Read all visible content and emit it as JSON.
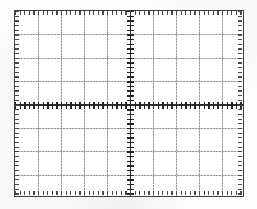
{
  "document": {
    "kind": "oscilloscope-graticule",
    "title": "Oscilloscope Graticule",
    "description": "Blank CRT oscilloscope screen graticule with 10 horizontal by 8 vertical divisions"
  },
  "canvas": {
    "width": 257,
    "height": 209,
    "background_color": "#fefefe"
  },
  "graticule": {
    "left": 14,
    "top": 10,
    "width": 230,
    "height": 187,
    "border_color": "#3d3d3d",
    "border_width": 1.5,
    "screen_color": "#ffffff",
    "divisions_x": 10,
    "divisions_y": 8,
    "division_width": 23.0,
    "division_height": 23.375,
    "grid_color": "#8f8f8f",
    "grid_style": "dotted"
  },
  "axes": {
    "color": "#2e2e2e",
    "vertical": {
      "label": "center-vertical-axis",
      "division_index": 5,
      "x": 115.0
    },
    "horizontal": {
      "label": "center-horizontal-axis",
      "division_index": 4,
      "y": 93.5
    }
  },
  "ticks": {
    "color": "#242424",
    "subdivisions_per_division": 5,
    "spacing_x": 4.6,
    "spacing_y": 4.675,
    "length": 7,
    "vertical_axis_tick_count": 41,
    "horizontal_axis_tick_count": 51
  },
  "edge_ticks": {
    "color": "#4a4a4a",
    "length": 4,
    "subdivisions_per_division": 5
  },
  "chart_data": {
    "type": "line",
    "subtitle": "",
    "xlabel": "",
    "ylabel": "",
    "xlim": [
      -5,
      5
    ],
    "ylim": [
      -4,
      4
    ],
    "xticks": [
      -5,
      -4,
      -3,
      -2,
      -1,
      0,
      1,
      2,
      3,
      4,
      5
    ],
    "yticks": [
      -4,
      -3,
      -2,
      -1,
      0,
      1,
      2,
      3,
      4
    ],
    "xtick_labels": [
      "",
      "",
      "",
      "",
      "",
      "",
      "",
      "",
      "",
      "",
      ""
    ],
    "ytick_labels": [
      "",
      "",
      "",
      "",
      "",
      "",
      "",
      "",
      ""
    ],
    "minor_ticks_per_division": 5,
    "grid": true,
    "legend": false,
    "series": [],
    "annotations": []
  }
}
